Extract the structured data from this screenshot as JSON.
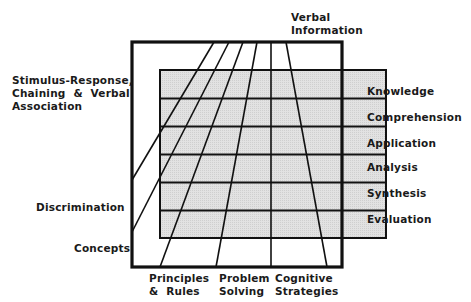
{
  "diagram": {
    "title": "",
    "outcomes_left": [
      {
        "id": "stimulus-response",
        "lines": [
          "Stimulus-Response,",
          "Chaining & Verbal",
          "Association"
        ]
      },
      {
        "id": "discrimination",
        "lines": [
          "Discrimination"
        ]
      },
      {
        "id": "concepts",
        "lines": [
          "Concepts"
        ]
      }
    ],
    "outcomes_top": [
      {
        "id": "verbal-information",
        "lines": [
          "Verbal",
          "Information"
        ]
      }
    ],
    "outcomes_bottom": [
      {
        "id": "principles-rules",
        "lines": [
          "Principles",
          "& Rules"
        ]
      },
      {
        "id": "problem-solving",
        "lines": [
          "Problem",
          "Solving"
        ]
      },
      {
        "id": "cognitive-strategies",
        "lines": [
          "Cognitive",
          "Strategies"
        ]
      }
    ],
    "taxonomy_levels": [
      "Knowledge",
      "Comprehension",
      "Application",
      "Analysis",
      "Synthesis",
      "Evaluation"
    ],
    "colors": {
      "line": "#111111",
      "shade": "#dcdcdc",
      "background": "#ffffff"
    }
  }
}
